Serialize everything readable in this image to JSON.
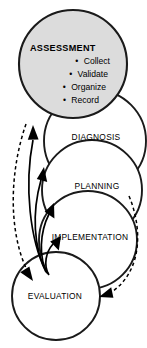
{
  "diagram": {
    "colors": {
      "shaded_fill": "#dcdcdc",
      "plain_fill": "#ffffff",
      "outline": "#1a1a1a",
      "arrow": "#000000",
      "background": "#ffffff"
    },
    "stages": [
      {
        "id": "assessment",
        "label": "ASSESSMENT",
        "shaded": true,
        "bullets": [
          {
            "marker": "•",
            "text": "Collect"
          },
          {
            "marker": "•",
            "text": "Validate"
          },
          {
            "marker": "•",
            "text": "Organize"
          },
          {
            "marker": "•",
            "text": "Record"
          }
        ]
      },
      {
        "id": "diagnosis",
        "label": "DIAGNOSIS",
        "shaded": false
      },
      {
        "id": "planning",
        "label": "PLANNING",
        "shaded": false
      },
      {
        "id": "implementation",
        "label": "IMPLEMENTATION",
        "shaded": false
      },
      {
        "id": "evaluation",
        "label": "EVALUATION",
        "shaded": false
      }
    ],
    "connectors": [
      {
        "id": "feedback-to-assessment",
        "style": "solid",
        "direction": "up"
      },
      {
        "id": "feedback-to-diagnosis",
        "style": "solid",
        "direction": "up"
      },
      {
        "id": "feedback-to-planning",
        "style": "solid",
        "direction": "up"
      },
      {
        "id": "feedback-to-implementation",
        "style": "solid",
        "direction": "up"
      },
      {
        "id": "assessment-to-evaluation",
        "style": "dashed",
        "direction": "down"
      },
      {
        "id": "cycle-return-right",
        "style": "dashed",
        "direction": "down"
      }
    ]
  }
}
